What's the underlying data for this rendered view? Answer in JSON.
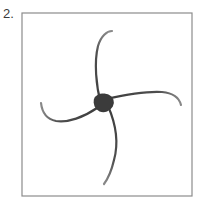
{
  "figure": {
    "label": "2.",
    "caption_position": "top-left",
    "background_color": "#ffffff",
    "frame": {
      "name": "panel-border",
      "x": 22,
      "y": 13,
      "width": 170,
      "height": 183,
      "stroke_color": "#8c8c8c",
      "stroke_width": 1.2,
      "fill": "none"
    },
    "drawing": {
      "type": "pinwheel-sketch",
      "description": "Four curved tapering arms spiralling counter-clockwise out of a solid dark central hub",
      "stroke_color": "#4a4a4a",
      "hub": {
        "name": "center-hub",
        "cx": 104,
        "cy": 103,
        "rx": 10,
        "ry": 9,
        "rotation": -20,
        "fill_color": "#3b3b3b"
      },
      "arms": [
        {
          "name": "arm-top",
          "direction": "up",
          "tip_x": 112,
          "tip_y": 31,
          "path": "M 101 104 C 96 86 94 62 98 46 C 101 36 107 31 112 31",
          "stroke_width": 2.2,
          "taper": true
        },
        {
          "name": "arm-right",
          "direction": "right",
          "tip_x": 181,
          "tip_y": 105,
          "path": "M 106 99 C 124 95 146 91 162 92 C 173 93 179 97 181 105",
          "stroke_width": 2.2,
          "taper": true
        },
        {
          "name": "arm-bottom",
          "direction": "down",
          "tip_x": 104,
          "tip_y": 184,
          "path": "M 108 106 C 115 122 119 142 114 160 C 111 173 107 180 104 184",
          "stroke_width": 2.2,
          "taper": true
        },
        {
          "name": "arm-left",
          "direction": "left",
          "tip_x": 41,
          "tip_y": 103,
          "path": "M 97 108 C 84 117 68 123 56 121 C 46 119 42 112 41 103",
          "stroke_width": 2.2,
          "taper": true
        }
      ]
    }
  }
}
